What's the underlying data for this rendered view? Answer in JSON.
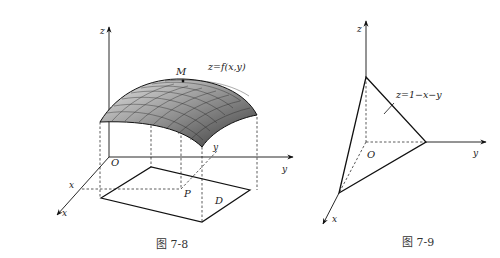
{
  "figures": [
    {
      "id": "fig-7-8",
      "caption": "图 7-8",
      "labels": {
        "z_axis": "z",
        "y_axis": "y",
        "x_axis": "x",
        "x_tick": "x",
        "y_tick": "y",
        "origin": "O",
        "point_m": "M",
        "point_p": "P",
        "region": "D",
        "surface_eq": "z=f(x,y)"
      }
    },
    {
      "id": "fig-7-9",
      "caption": "图 7-9",
      "labels": {
        "z_axis": "z",
        "y_axis": "y",
        "x_axis": "x",
        "origin": "O",
        "plane_eq": "z=1−x−y"
      }
    }
  ]
}
